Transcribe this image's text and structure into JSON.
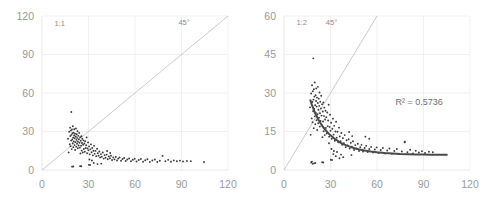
{
  "figure": {
    "background": "#ffffff",
    "point_color": "#3c3c3c",
    "grid_color": "#ededed",
    "diagonal_color": "#b4b4b4",
    "trend_color": "#4a4a4a",
    "tick_color": "#9a9a9a"
  },
  "chart_data": [
    {
      "type": "scatter",
      "title": "",
      "panel_label": "1:1",
      "xlabel": "",
      "ylabel": "",
      "xlim": [
        0,
        120
      ],
      "ylim": [
        0,
        120
      ],
      "xticks": [
        0,
        30,
        60,
        90,
        120
      ],
      "yticks": [
        0,
        30,
        60,
        90,
        120
      ],
      "grid": true,
      "legend": "none",
      "annotations": [
        {
          "text": "1:1",
          "x": 8,
          "y": 112
        },
        {
          "text": "45°",
          "x": 88,
          "y": 113
        }
      ],
      "reference_line": {
        "label": "45°",
        "slope": 1,
        "intercept": 0,
        "from": [
          0,
          0
        ],
        "to": [
          120,
          120
        ]
      },
      "points": [
        [
          16.8,
          24.4
        ],
        [
          17.2,
          13.7
        ],
        [
          17.5,
          29.8
        ],
        [
          17.9,
          20.1
        ],
        [
          18.1,
          33.0
        ],
        [
          18.3,
          26.5
        ],
        [
          18.4,
          18.6
        ],
        [
          18.6,
          30.7
        ],
        [
          18.8,
          22.9
        ],
        [
          18.9,
          45.2
        ],
        [
          19.0,
          27.4
        ],
        [
          19.2,
          16.3
        ],
        [
          19.3,
          31.5
        ],
        [
          19.5,
          23.8
        ],
        [
          19.6,
          28.6
        ],
        [
          19.8,
          20.9
        ],
        [
          19.9,
          34.1
        ],
        [
          20.1,
          25.2
        ],
        [
          20.2,
          17.8
        ],
        [
          20.4,
          29.1
        ],
        [
          20.5,
          22.3
        ],
        [
          20.7,
          26.9
        ],
        [
          20.8,
          31.8
        ],
        [
          21.0,
          19.4
        ],
        [
          21.1,
          24.7
        ],
        [
          21.3,
          28.2
        ],
        [
          21.4,
          15.6
        ],
        [
          21.6,
          21.7
        ],
        [
          21.8,
          26.1
        ],
        [
          21.9,
          32.4
        ],
        [
          22.1,
          18.2
        ],
        [
          22.2,
          23.5
        ],
        [
          22.4,
          27.8
        ],
        [
          22.6,
          20.4
        ],
        [
          22.7,
          25.0
        ],
        [
          22.9,
          30.2
        ],
        [
          23.1,
          16.9
        ],
        [
          23.2,
          22.1
        ],
        [
          23.4,
          26.6
        ],
        [
          23.6,
          19.1
        ],
        [
          23.8,
          24.0
        ],
        [
          24.0,
          28.9
        ],
        [
          24.2,
          21.2
        ],
        [
          24.4,
          17.4
        ],
        [
          24.6,
          25.6
        ],
        [
          24.8,
          12.8
        ],
        [
          25.0,
          22.8
        ],
        [
          25.2,
          18.9
        ],
        [
          25.4,
          26.3
        ],
        [
          25.6,
          15.1
        ],
        [
          25.8,
          21.0
        ],
        [
          26.0,
          24.3
        ],
        [
          26.3,
          13.6
        ],
        [
          26.5,
          19.7
        ],
        [
          26.8,
          23.1
        ],
        [
          27.0,
          16.4
        ],
        [
          27.3,
          20.6
        ],
        [
          27.6,
          14.2
        ],
        [
          27.9,
          22.4
        ],
        [
          28.2,
          17.1
        ],
        [
          28.5,
          19.3
        ],
        [
          28.8,
          25.4
        ],
        [
          29.1,
          13.0
        ],
        [
          29.4,
          16.8
        ],
        [
          29.7,
          21.5
        ],
        [
          30.0,
          15.3
        ],
        [
          30.4,
          18.4
        ],
        [
          30.8,
          12.2
        ],
        [
          31.2,
          16.1
        ],
        [
          31.6,
          20.0
        ],
        [
          32.0,
          13.8
        ],
        [
          32.4,
          17.2
        ],
        [
          32.8,
          11.4
        ],
        [
          33.2,
          15.0
        ],
        [
          33.6,
          18.8
        ],
        [
          34.0,
          12.6
        ],
        [
          34.5,
          14.9
        ],
        [
          35.0,
          10.8
        ],
        [
          35.5,
          16.5
        ],
        [
          36.0,
          13.1
        ],
        [
          36.5,
          11.2
        ],
        [
          37.0,
          14.4
        ],
        [
          37.5,
          9.8
        ],
        [
          38.0,
          12.4
        ],
        [
          38.6,
          10.4
        ],
        [
          39.2,
          13.6
        ],
        [
          39.8,
          8.9
        ],
        [
          40.4,
          11.6
        ],
        [
          41.0,
          9.6
        ],
        [
          41.7,
          12.0
        ],
        [
          42.4,
          8.4
        ],
        [
          43.1,
          10.6
        ],
        [
          43.8,
          9.1
        ],
        [
          44.5,
          11.2
        ],
        [
          45.2,
          7.8
        ],
        [
          46.0,
          9.7
        ],
        [
          46.8,
          8.3
        ],
        [
          47.6,
          10.2
        ],
        [
          48.4,
          7.4
        ],
        [
          49.2,
          8.9
        ],
        [
          50.0,
          9.8
        ],
        [
          51.0,
          7.2
        ],
        [
          52.0,
          8.6
        ],
        [
          53.0,
          9.4
        ],
        [
          54.0,
          7.0
        ],
        [
          55.0,
          8.2
        ],
        [
          56.2,
          9.0
        ],
        [
          57.4,
          6.8
        ],
        [
          58.6,
          8.0
        ],
        [
          59.8,
          8.8
        ],
        [
          61.0,
          6.6
        ],
        [
          62.4,
          7.8
        ],
        [
          63.8,
          8.6
        ],
        [
          65.2,
          6.4
        ],
        [
          66.6,
          7.6
        ],
        [
          68.0,
          8.4
        ],
        [
          69.6,
          6.3
        ],
        [
          71.2,
          7.4
        ],
        [
          72.8,
          8.2
        ],
        [
          74.4,
          6.2
        ],
        [
          76.0,
          7.2
        ],
        [
          77.8,
          11.0
        ],
        [
          79.6,
          6.9
        ],
        [
          81.4,
          7.9
        ],
        [
          83.2,
          6.4
        ],
        [
          85.0,
          7.5
        ],
        [
          87.0,
          6.8
        ],
        [
          89.0,
          7.3
        ],
        [
          91.0,
          6.6
        ],
        [
          93.5,
          7.1
        ],
        [
          96.0,
          6.9
        ],
        [
          104.5,
          6.2
        ],
        [
          19.4,
          2.6
        ],
        [
          20.2,
          2.7
        ],
        [
          24.6,
          3.0
        ],
        [
          25.3,
          2.9
        ],
        [
          30.2,
          4.0
        ],
        [
          31.0,
          3.9
        ],
        [
          33.4,
          5.4
        ],
        [
          35.8,
          4.6
        ],
        [
          38.2,
          5.0
        ],
        [
          42.0,
          14.8
        ],
        [
          44.0,
          13.2
        ],
        [
          30.6,
          8.2
        ],
        [
          32.2,
          7.4
        ]
      ]
    },
    {
      "type": "scatter",
      "title": "",
      "panel_label": "1:2",
      "xlabel": "",
      "ylabel": "",
      "xlim": [
        0,
        120
      ],
      "ylim": [
        0,
        60
      ],
      "xticks": [
        0,
        30,
        60,
        90,
        120
      ],
      "yticks": [
        0,
        15,
        30,
        45,
        60
      ],
      "grid": true,
      "legend": "none",
      "annotations": [
        {
          "text": "1:2",
          "x": 8,
          "y": 56.5
        },
        {
          "text": "45°",
          "x": 27,
          "y": 56.5
        },
        {
          "text": "R² = 0.5736",
          "x": 72,
          "y": 25.5
        }
      ],
      "r_squared": 0.5736,
      "r_squared_label": "R² = 0.5736",
      "reference_line": {
        "label": "45°",
        "slope": 1,
        "intercept": 0,
        "from": [
          0,
          0
        ],
        "to": [
          60,
          60
        ]
      },
      "trendline": {
        "type": "power",
        "points": [
          [
            17.0,
            27.2
          ],
          [
            18.0,
            25.4
          ],
          [
            19.0,
            23.8
          ],
          [
            20.0,
            22.3
          ],
          [
            22.0,
            19.8
          ],
          [
            24.0,
            17.8
          ],
          [
            26.0,
            16.1
          ],
          [
            28.0,
            14.7
          ],
          [
            30.0,
            13.5
          ],
          [
            33.0,
            12.0
          ],
          [
            36.0,
            10.8
          ],
          [
            39.0,
            9.9
          ],
          [
            42.0,
            9.2
          ],
          [
            45.0,
            8.6
          ],
          [
            48.0,
            8.1
          ],
          [
            52.0,
            7.6
          ],
          [
            56.0,
            7.2
          ],
          [
            60.0,
            6.9
          ],
          [
            65.0,
            6.6
          ],
          [
            70.0,
            6.4
          ],
          [
            75.0,
            6.2
          ],
          [
            80.0,
            6.1
          ],
          [
            85.0,
            6.0
          ],
          [
            90.0,
            6.0
          ],
          [
            95.0,
            5.9
          ],
          [
            100.0,
            5.9
          ],
          [
            105.0,
            5.9
          ]
        ]
      },
      "points": [
        [
          16.8,
          24.4
        ],
        [
          17.2,
          13.7
        ],
        [
          17.5,
          29.8
        ],
        [
          17.9,
          20.1
        ],
        [
          18.1,
          33.0
        ],
        [
          18.3,
          26.5
        ],
        [
          18.4,
          18.6
        ],
        [
          18.6,
          30.7
        ],
        [
          18.8,
          22.9
        ],
        [
          18.9,
          43.5
        ],
        [
          19.0,
          27.4
        ],
        [
          19.2,
          16.3
        ],
        [
          19.3,
          31.5
        ],
        [
          19.5,
          23.8
        ],
        [
          19.6,
          28.6
        ],
        [
          19.8,
          20.9
        ],
        [
          19.9,
          34.1
        ],
        [
          20.1,
          25.2
        ],
        [
          20.2,
          17.8
        ],
        [
          20.4,
          29.1
        ],
        [
          20.5,
          22.3
        ],
        [
          20.7,
          26.9
        ],
        [
          20.8,
          31.8
        ],
        [
          21.0,
          19.4
        ],
        [
          21.1,
          24.7
        ],
        [
          21.3,
          28.2
        ],
        [
          21.4,
          15.6
        ],
        [
          21.6,
          21.7
        ],
        [
          21.8,
          26.1
        ],
        [
          21.9,
          32.4
        ],
        [
          22.1,
          18.2
        ],
        [
          22.2,
          23.5
        ],
        [
          22.4,
          27.8
        ],
        [
          22.6,
          20.4
        ],
        [
          22.7,
          25.0
        ],
        [
          22.9,
          30.2
        ],
        [
          23.1,
          16.9
        ],
        [
          23.2,
          22.1
        ],
        [
          23.4,
          26.6
        ],
        [
          23.6,
          19.1
        ],
        [
          23.8,
          24.0
        ],
        [
          24.0,
          28.9
        ],
        [
          24.2,
          21.2
        ],
        [
          24.4,
          17.4
        ],
        [
          24.6,
          25.6
        ],
        [
          24.8,
          12.8
        ],
        [
          25.0,
          22.8
        ],
        [
          25.2,
          18.9
        ],
        [
          25.4,
          26.3
        ],
        [
          25.6,
          15.1
        ],
        [
          25.8,
          21.0
        ],
        [
          26.0,
          24.3
        ],
        [
          26.3,
          13.6
        ],
        [
          26.5,
          19.7
        ],
        [
          26.8,
          23.1
        ],
        [
          27.0,
          16.4
        ],
        [
          27.3,
          20.6
        ],
        [
          27.6,
          14.2
        ],
        [
          27.9,
          22.4
        ],
        [
          28.2,
          17.1
        ],
        [
          28.5,
          19.3
        ],
        [
          28.8,
          25.4
        ],
        [
          29.1,
          13.0
        ],
        [
          29.4,
          16.8
        ],
        [
          29.7,
          21.5
        ],
        [
          30.0,
          15.3
        ],
        [
          30.4,
          18.4
        ],
        [
          30.8,
          12.2
        ],
        [
          31.2,
          16.1
        ],
        [
          31.6,
          20.0
        ],
        [
          32.0,
          13.8
        ],
        [
          32.4,
          17.2
        ],
        [
          32.8,
          11.4
        ],
        [
          33.2,
          15.0
        ],
        [
          33.6,
          18.8
        ],
        [
          34.0,
          12.6
        ],
        [
          34.5,
          14.9
        ],
        [
          35.0,
          10.8
        ],
        [
          35.5,
          16.5
        ],
        [
          36.0,
          13.1
        ],
        [
          36.5,
          11.2
        ],
        [
          37.0,
          14.4
        ],
        [
          37.5,
          9.8
        ],
        [
          38.0,
          12.4
        ],
        [
          38.6,
          10.4
        ],
        [
          39.2,
          13.6
        ],
        [
          39.8,
          8.9
        ],
        [
          40.4,
          11.6
        ],
        [
          41.0,
          9.6
        ],
        [
          41.7,
          12.0
        ],
        [
          42.4,
          8.4
        ],
        [
          43.1,
          10.6
        ],
        [
          43.8,
          9.1
        ],
        [
          44.5,
          11.2
        ],
        [
          45.2,
          7.8
        ],
        [
          46.0,
          9.7
        ],
        [
          46.8,
          8.3
        ],
        [
          47.6,
          10.2
        ],
        [
          48.4,
          7.4
        ],
        [
          49.2,
          8.9
        ],
        [
          50.0,
          9.8
        ],
        [
          51.0,
          7.2
        ],
        [
          52.0,
          8.6
        ],
        [
          53.0,
          9.4
        ],
        [
          54.0,
          7.0
        ],
        [
          55.0,
          8.2
        ],
        [
          56.2,
          9.0
        ],
        [
          57.4,
          6.8
        ],
        [
          58.6,
          8.0
        ],
        [
          59.8,
          8.8
        ],
        [
          61.0,
          6.6
        ],
        [
          62.4,
          7.8
        ],
        [
          63.8,
          8.6
        ],
        [
          65.2,
          6.4
        ],
        [
          66.6,
          7.6
        ],
        [
          68.0,
          8.4
        ],
        [
          69.6,
          6.3
        ],
        [
          71.2,
          7.4
        ],
        [
          72.8,
          8.2
        ],
        [
          74.4,
          6.2
        ],
        [
          76.0,
          7.2
        ],
        [
          77.8,
          10.8
        ],
        [
          79.6,
          6.9
        ],
        [
          81.4,
          7.9
        ],
        [
          83.2,
          6.4
        ],
        [
          85.0,
          7.5
        ],
        [
          87.0,
          6.8
        ],
        [
          89.0,
          7.3
        ],
        [
          91.0,
          6.6
        ],
        [
          93.5,
          7.1
        ],
        [
          96.0,
          6.9
        ],
        [
          18.5,
          2.4
        ],
        [
          19.4,
          2.6
        ],
        [
          20.2,
          2.7
        ],
        [
          24.6,
          3.0
        ],
        [
          25.3,
          2.9
        ],
        [
          30.2,
          4.0
        ],
        [
          31.0,
          3.9
        ],
        [
          33.4,
          5.4
        ],
        [
          35.8,
          4.6
        ],
        [
          38.2,
          5.0
        ],
        [
          42.0,
          14.8
        ],
        [
          44.0,
          13.2
        ],
        [
          30.6,
          8.2
        ],
        [
          32.2,
          7.4
        ],
        [
          52.5,
          13.0
        ],
        [
          55.0,
          12.2
        ],
        [
          78.0,
          11.0
        ],
        [
          18.0,
          3.2
        ],
        [
          17.5,
          2.9
        ],
        [
          29.0,
          10.4
        ],
        [
          31.8,
          6.2
        ],
        [
          34.2,
          7.0
        ],
        [
          36.8,
          6.0
        ],
        [
          43.5,
          5.8
        ]
      ]
    }
  ]
}
